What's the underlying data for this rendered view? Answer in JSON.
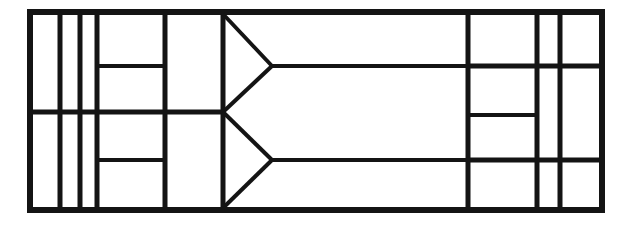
{
  "document": {
    "title": "Partition Line Diagram",
    "kind": "technical-line-drawing",
    "background_color": "#ffffff",
    "stroke_color": "#141414",
    "canvas": {
      "width": 629,
      "height": 227
    }
  },
  "geometry": {
    "outer_frame": {
      "name": "outer-rectangle",
      "x": 30,
      "y": 12,
      "width": 572,
      "height": 198,
      "stroke_width": 6
    },
    "stroke_widths": {
      "outer": 6,
      "major": 5,
      "minor": 4,
      "diagonal": 4
    },
    "vertical_lines": [
      {
        "name": "vline-1",
        "x": 60,
        "y1": 12,
        "y2": 210,
        "weight": "major"
      },
      {
        "name": "vline-2",
        "x": 80,
        "y1": 12,
        "y2": 210,
        "weight": "major"
      },
      {
        "name": "vline-3",
        "x": 97,
        "y1": 12,
        "y2": 210,
        "weight": "major"
      },
      {
        "name": "vline-4",
        "x": 165,
        "y1": 12,
        "y2": 210,
        "weight": "major"
      },
      {
        "name": "vline-5",
        "x": 223,
        "y1": 12,
        "y2": 210,
        "weight": "major"
      },
      {
        "name": "vline-6",
        "x": 468,
        "y1": 12,
        "y2": 210,
        "weight": "major"
      },
      {
        "name": "vline-7",
        "x": 537,
        "y1": 12,
        "y2": 210,
        "weight": "major"
      },
      {
        "name": "vline-8",
        "x": 560,
        "y1": 12,
        "y2": 210,
        "weight": "major"
      }
    ],
    "horizontal_lines": [
      {
        "name": "hline-mid-left",
        "y": 112,
        "x1": 30,
        "x2": 223,
        "weight": "major"
      },
      {
        "name": "hline-upper-cell",
        "y": 66,
        "x1": 97,
        "x2": 165,
        "weight": "minor"
      },
      {
        "name": "hline-lower-cell",
        "y": 160,
        "x1": 97,
        "x2": 165,
        "weight": "minor"
      },
      {
        "name": "hline-mid-right-upper",
        "y": 66,
        "x1": 468,
        "x2": 602,
        "weight": "major"
      },
      {
        "name": "hline-right-notch",
        "y": 115,
        "x1": 468,
        "x2": 537,
        "weight": "minor"
      },
      {
        "name": "hline-mid-right-lower",
        "y": 160,
        "x1": 468,
        "x2": 602,
        "weight": "major"
      },
      {
        "name": "hline-chevron-upper-stem",
        "y": 66,
        "x1": 272,
        "x2": 468,
        "weight": "minor"
      },
      {
        "name": "hline-chevron-lower-stem",
        "y": 160,
        "x1": 272,
        "x2": 468,
        "weight": "minor"
      }
    ],
    "chevrons": [
      {
        "name": "chevron-upper",
        "apex_x": 272,
        "apex_y": 66,
        "base_x": 223,
        "top_y": 14,
        "bottom_y": 112
      },
      {
        "name": "chevron-lower",
        "apex_x": 272,
        "apex_y": 160,
        "base_x": 223,
        "top_y": 112,
        "bottom_y": 208
      }
    ]
  }
}
